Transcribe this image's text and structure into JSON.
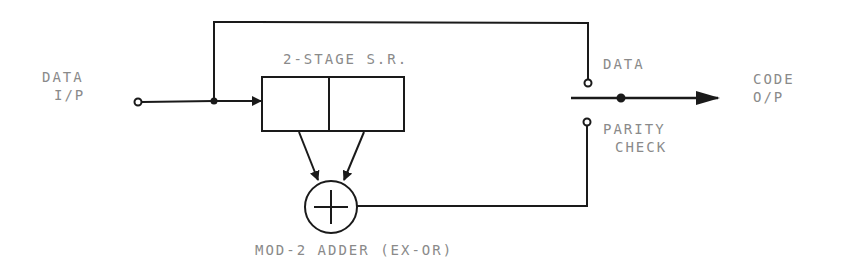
{
  "diagram": {
    "labels": {
      "data_input_line1": "DATA",
      "data_input_line2": "I/P",
      "shift_register": "2-STAGE S.R.",
      "data_contact": "DATA",
      "parity_line1": "PARITY",
      "parity_line2": "CHECK",
      "code_output_line1": "CODE",
      "code_output_line2": "O/P",
      "adder": "MOD-2 ADDER (EX-OR)"
    },
    "components": {
      "shift_register_stages": 2,
      "adder_symbol": "circle-plus"
    },
    "colors": {
      "line": "#1a1a1a",
      "text": "#8a8a8a",
      "background": "#ffffff"
    }
  }
}
